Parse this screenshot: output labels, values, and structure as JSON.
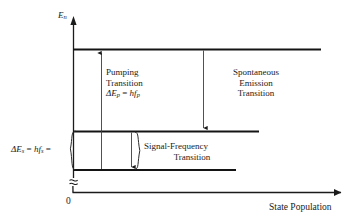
{
  "diagram": {
    "kind": "three-level-laser-energy-diagram",
    "axes": {
      "y_label": "E",
      "y_label_subscript": "n",
      "x_label": "State Population",
      "origin_label": "0",
      "y_axis_break_icon": "axis-break-icon",
      "x_arrow_icon": "arrow-right-icon",
      "y_arrow_icon": "arrow-up-icon"
    },
    "levels": [
      {
        "name": "upper-energy-level"
      },
      {
        "name": "middle-energy-level"
      },
      {
        "name": "lower-energy-level"
      }
    ],
    "transitions": [
      {
        "name": "pumping-transition",
        "line1": "Pumping",
        "line2": "Transition",
        "line3_delta": "ΔE",
        "line3_sub1": "p",
        "line3_eq": " = ",
        "line3_h": "hf",
        "line3_sub2": "p",
        "arrow_icon": "arrow-up-icon",
        "direction": "up"
      },
      {
        "name": "spontaneous-emission-transition",
        "line1": "Spontaneous",
        "line2": "Emission",
        "line3": "Transition",
        "arrow_icon": "arrow-down-icon",
        "direction": "down"
      },
      {
        "name": "signal-frequency-transition",
        "line1": "Signal-Frequency",
        "line2": "Transition",
        "arrow_icon": "arrow-down-icon",
        "direction": "down"
      }
    ],
    "energy_gap_label": {
      "name": "signal-energy-gap-label",
      "delta": "ΔE",
      "sub1": "s",
      "eq1": " = ",
      "h": "hf",
      "sub2": "s",
      "eq2": " =",
      "brace_icon": "left-curly-brace-icon"
    },
    "braces": [
      {
        "name": "energy-gap-brace-icon"
      },
      {
        "name": "signal-transition-brace-icon"
      }
    ],
    "colors": {
      "ink": "#1b1b1b",
      "level_line": "#141414",
      "thin_line": "#4a4a4a",
      "background": "#ffffff"
    }
  }
}
